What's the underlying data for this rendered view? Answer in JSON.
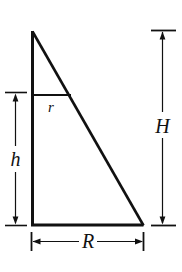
{
  "figure": {
    "type": "geometry-diagram",
    "background_color": "#ffffff",
    "stroke_color": "#111111",
    "labels": {
      "height_small": "h",
      "height_large": "H",
      "radius_large": "R",
      "radius_small": "r"
    },
    "geometry": {
      "apex": [
        32,
        31
      ],
      "bottom_left": [
        32,
        225
      ],
      "bottom_right": [
        143,
        225
      ],
      "r_line_start": [
        32,
        95
      ],
      "r_line_end": [
        71,
        95
      ]
    },
    "dimensions": [
      {
        "name": "h",
        "orientation": "vertical",
        "axis_x": 15,
        "from_y": 95,
        "to_y": 225
      },
      {
        "name": "H",
        "orientation": "vertical",
        "axis_x": 162,
        "from_y": 31,
        "to_y": 225
      },
      {
        "name": "R",
        "orientation": "horizontal",
        "axis_y": 241,
        "from_x": 32,
        "to_x": 143
      },
      {
        "name": "r",
        "orientation": "horizontal",
        "axis_y": 95,
        "from_x": 32,
        "to_x": 71
      }
    ]
  }
}
